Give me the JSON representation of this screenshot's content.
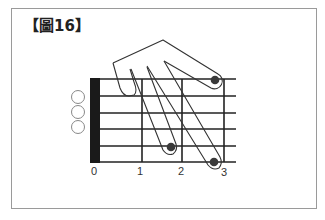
{
  "figure": {
    "title": "【圖16】"
  },
  "diagram": {
    "type": "guitar-chord-fingering",
    "fret_labels": [
      "0",
      "1",
      "2",
      "3"
    ],
    "open_strings": 3,
    "fingered_positions": [
      {
        "string": 1,
        "fret": 3
      },
      {
        "string": 5,
        "fret": 2
      },
      {
        "string": 6,
        "fret": 3
      }
    ],
    "colors": {
      "line": "#222222",
      "nut": "#1a1a1a",
      "dot": "#3a3a3a",
      "frame": "#9a9a9a"
    }
  }
}
